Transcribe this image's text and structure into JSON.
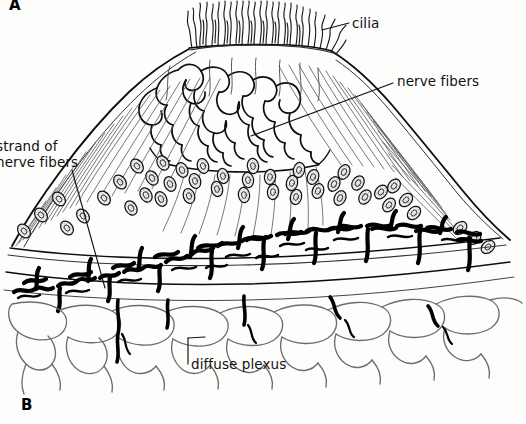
{
  "figure": {
    "type": "scientific-line-drawing",
    "background_color": "#fdfdfb",
    "ink_color": "#111111",
    "panels": [
      {
        "id": "A",
        "letter": "A",
        "position": "top-left",
        "clipped_at_top": true
      },
      {
        "id": "B",
        "letter": "B",
        "position": "bottom-left"
      }
    ],
    "labels": [
      {
        "id": "cilia",
        "text": "cilia",
        "leader": true,
        "points_to": "hair tuft at apex of mound"
      },
      {
        "id": "nerve_fibers",
        "text": "nerve fibers",
        "leader": true,
        "points_to": "branching fiber network on upper surface of mound"
      },
      {
        "id": "strand_of_nerve_fibers_line1",
        "text": "strand of",
        "leader": true,
        "points_to": "dark squiggly strand descending through left flank"
      },
      {
        "id": "strand_of_nerve_fibers_line2",
        "text": "nerve fibers",
        "leader": false,
        "clipped_at_left": true
      },
      {
        "id": "diffuse_plexus",
        "text": "diffuse plexus",
        "leader": true,
        "points_to": "polygonal cell meshwork beneath the basal band"
      }
    ],
    "features": {
      "cilia_tuft": "dense wavy hair-like strands rising from flat apex",
      "mound": "broad dome with fine radiating striations on both flanks",
      "nuclei": "stippled elliptical nuclei arranged in diagonal rows along fibers",
      "plexus_band": "thick black irregular squiggle band across the base",
      "basal_cells": "loose mesh of thin grey polygonal cell outlines"
    }
  }
}
